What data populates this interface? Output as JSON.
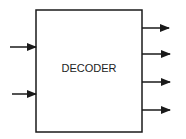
{
  "diagram": {
    "block": {
      "label": "DECODER"
    },
    "inputs": [
      {
        "name": "input-1"
      },
      {
        "name": "input-2"
      }
    ],
    "outputs": [
      {
        "name": "output-1"
      },
      {
        "name": "output-2"
      },
      {
        "name": "output-3"
      },
      {
        "name": "output-4"
      }
    ],
    "colors": {
      "stroke": "#1a1a1a",
      "text": "#222222",
      "background": "#ffffff"
    }
  }
}
